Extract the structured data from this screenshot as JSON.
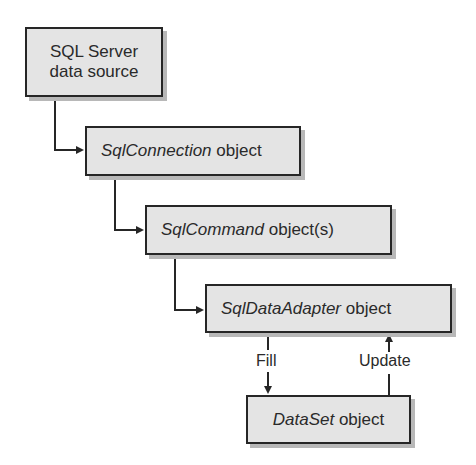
{
  "diagram": {
    "nodes": [
      {
        "id": "sqlserver",
        "line1": "SQL Server",
        "line2": "data source"
      },
      {
        "id": "connection",
        "italic": "SqlConnection",
        "suffix": " object"
      },
      {
        "id": "command",
        "italic": "SqlCommand",
        "suffix": " object(s)"
      },
      {
        "id": "adapter",
        "italic": "SqlDataAdapter",
        "suffix": " object"
      },
      {
        "id": "dataset",
        "italic": "DataSet",
        "suffix": " object"
      }
    ],
    "edges": [
      {
        "from": "sqlserver",
        "to": "connection",
        "type": "bidirectional"
      },
      {
        "from": "connection",
        "to": "command",
        "type": "bidirectional"
      },
      {
        "from": "command",
        "to": "adapter",
        "type": "bidirectional"
      },
      {
        "from": "adapter",
        "to": "dataset",
        "label": "Fill"
      },
      {
        "from": "dataset",
        "to": "adapter",
        "label": "Update"
      }
    ],
    "colors": {
      "box_fill": "#e4e4e4",
      "border": "#262626",
      "shadow": "#b8b8b8"
    }
  }
}
